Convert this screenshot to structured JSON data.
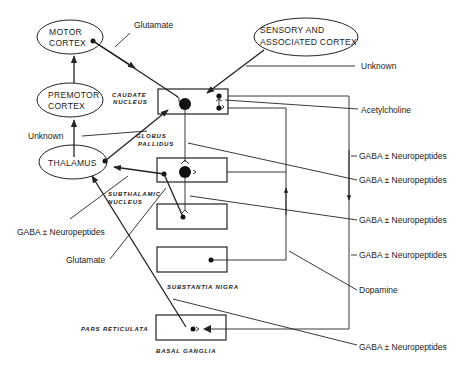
{
  "nodes": {
    "motor_cortex": [
      "MOTOR",
      "CORTEX"
    ],
    "premotor_cortex": [
      "PREMOTOR",
      "CORTEX"
    ],
    "sensory_cortex": [
      "SENSORY AND",
      "ASSOCIATED CORTEX"
    ],
    "thalamus": "THALAMUS"
  },
  "regions": {
    "caudate": [
      "CAUDATE",
      "NUCLEUS"
    ],
    "globus": [
      "GLOBUS",
      "PALLIDUS"
    ],
    "subthalamic": [
      "SUBTHALAMIC",
      "NUCLEUS"
    ],
    "substantia_nigra": "SUBSTANTIA NIGRA",
    "pars_reticulata": "PARS RETICULATA",
    "basal_ganglia": "BASAL GANGLIA"
  },
  "labels": {
    "glutamate_top": "Glutamate",
    "unknown_right": "Unknown",
    "acetylcholine": "Acetylcholine",
    "unknown_left": "Unknown",
    "gaba_1": "GABA ± Neuropeptides",
    "gaba_2": "GABA ± Neuropeptides",
    "gaba_left": "GABA ± Neuropeptides",
    "gaba_3": "GABA ± Neuropeptides",
    "glutamate_left": "Glutamate",
    "gaba_4": "GABA ± Neuropeptides",
    "dopamine": "Dopamine",
    "gaba_5": "GABA ± Neuropeptides"
  }
}
